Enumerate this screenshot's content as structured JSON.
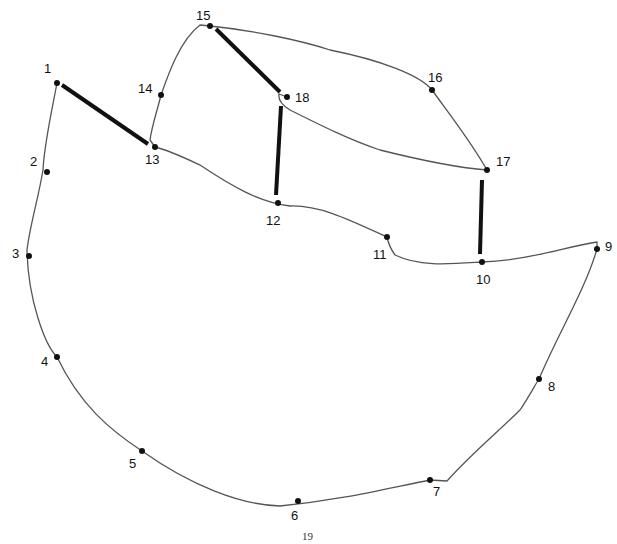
{
  "page": {
    "number": "19"
  },
  "points": [
    {
      "n": "1",
      "x": 57,
      "y": 83,
      "lx": 44,
      "ly": 73
    },
    {
      "n": "2",
      "x": 47,
      "y": 172,
      "lx": 30,
      "ly": 166
    },
    {
      "n": "3",
      "x": 29,
      "y": 256,
      "lx": 12,
      "ly": 258
    },
    {
      "n": "4",
      "x": 57,
      "y": 357,
      "lx": 41,
      "ly": 366
    },
    {
      "n": "5",
      "x": 142,
      "y": 451,
      "lx": 129,
      "ly": 468
    },
    {
      "n": "6",
      "x": 298,
      "y": 501,
      "lx": 291,
      "ly": 520
    },
    {
      "n": "7",
      "x": 430,
      "y": 480,
      "lx": 433,
      "ly": 496
    },
    {
      "n": "8",
      "x": 539,
      "y": 379,
      "lx": 548,
      "ly": 391
    },
    {
      "n": "9",
      "x": 597,
      "y": 249,
      "lx": 605,
      "ly": 251
    },
    {
      "n": "10",
      "x": 482,
      "y": 262,
      "lx": 476,
      "ly": 284
    },
    {
      "n": "11",
      "x": 387,
      "y": 237,
      "lx": 373,
      "ly": 259
    },
    {
      "n": "12",
      "x": 278,
      "y": 203,
      "lx": 266,
      "ly": 225
    },
    {
      "n": "13",
      "x": 155,
      "y": 147,
      "lx": 145,
      "ly": 164
    },
    {
      "n": "14",
      "x": 161,
      "y": 95,
      "lx": 138,
      "ly": 93
    },
    {
      "n": "15",
      "x": 210,
      "y": 26,
      "lx": 196,
      "ly": 20
    },
    {
      "n": "16",
      "x": 432,
      "y": 90,
      "lx": 428,
      "ly": 82
    },
    {
      "n": "17",
      "x": 487,
      "y": 170,
      "lx": 496,
      "ly": 166
    },
    {
      "n": "18",
      "x": 287,
      "y": 97,
      "lx": 295,
      "ly": 102
    }
  ],
  "outline_path": "M57,83 C52,110 44,145 43,170 C38,200 30,225 27,250 C28,300 45,345 57,357 C80,405 110,430 142,451 C190,485 240,505 280,506 C340,500 380,490 430,480 L447,481 C470,455 500,430 520,410 C530,395 535,385 539,379 C560,330 585,290 597,249 L597,242 C560,248 530,260 482,262 C450,264 420,267 395,255 C390,248 388,242 387,237 C350,220 320,205 290,206 C260,203 230,185 200,165 C185,158 168,150 155,147 L150,140 C152,125 158,108 161,95 C168,75 180,40 200,25 L210,26 C250,30 300,40 330,50 C380,60 420,75 432,90 C450,115 470,140 487,170 C460,168 420,160 380,150 C350,140 320,125 290,110 C282,105 278,100 279,94 L287,97",
  "bold_lines": [
    {
      "from": "1",
      "x1": 62,
      "y1": 85,
      "x2": 148,
      "y2": 144
    },
    {
      "from": "15",
      "x1": 216,
      "y1": 29,
      "x2": 280,
      "y2": 92
    },
    {
      "from": "18",
      "x1": 281,
      "y1": 106,
      "x2": 276,
      "y2": 195
    },
    {
      "from": "17",
      "x1": 482,
      "y1": 180,
      "x2": 480,
      "y2": 254
    }
  ]
}
